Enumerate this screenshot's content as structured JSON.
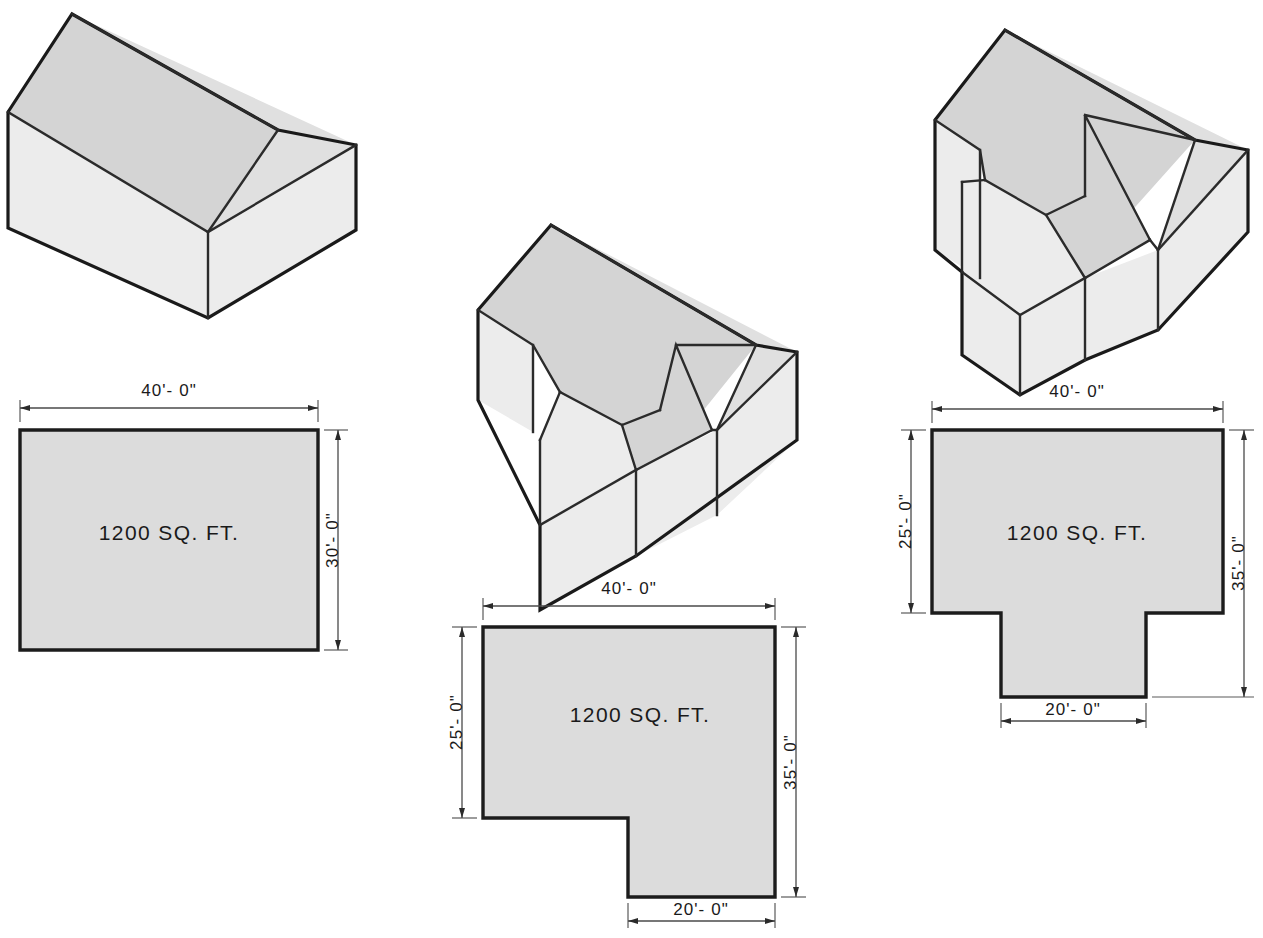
{
  "page": {
    "background_color": "#ffffff",
    "line_color": "#1a1a1a",
    "plan_fill_color": "#dcdcdc",
    "roof_light_color": "#ececec",
    "roof_mid_color": "#e0e0e0",
    "roof_dark_color": "#d4d4d4",
    "cropped_caption": ""
  },
  "figures": [
    {
      "id": "rectangular-gable",
      "model_name": "gable-roof-rectangular-house-isometric",
      "plan_name": "rectangular-floor-plan",
      "plan_shape": "rectangle",
      "area_label": "1200 SQ. FT.",
      "dimensions": {
        "top": "40'- 0\"",
        "right": "30'- 0\"",
        "left": "",
        "bottom": ""
      }
    },
    {
      "id": "l-shaped-gable",
      "model_name": "gable-roof-l-shaped-house-isometric",
      "plan_name": "l-shaped-floor-plan",
      "plan_shape": "L-shape",
      "area_label": "1200 SQ. FT.",
      "dimensions": {
        "top": "40'- 0\"",
        "right": "35'- 0\"",
        "left": "25'- 0\"",
        "bottom": "20'- 0\""
      }
    },
    {
      "id": "t-shaped-gable",
      "model_name": "gable-roof-t-shaped-house-isometric",
      "plan_name": "t-shaped-floor-plan",
      "plan_shape": "T-shape",
      "area_label": "1200 SQ. FT.",
      "dimensions": {
        "top": "40'- 0\"",
        "right": "35'- 0\"",
        "left": "25'- 0\"",
        "bottom": "20'- 0\""
      }
    }
  ]
}
